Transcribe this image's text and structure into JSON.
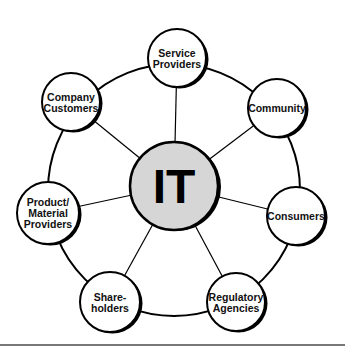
{
  "diagram": {
    "type": "hub-and-spoke",
    "center": {
      "label": "IT",
      "x": 174,
      "y": 186,
      "r": 44,
      "fill": "#d6d6d6"
    },
    "ring": {
      "cx": 174,
      "cy": 190,
      "r": 126
    },
    "nodes": [
      {
        "id": "service-providers",
        "lines": [
          "Service",
          "Providers"
        ],
        "x": 177,
        "y": 58,
        "r": 29
      },
      {
        "id": "community",
        "lines": [
          "Community"
        ],
        "x": 277,
        "y": 108,
        "r": 29
      },
      {
        "id": "consumers",
        "lines": [
          "Consumers"
        ],
        "x": 296,
        "y": 216,
        "r": 29
      },
      {
        "id": "regulatory-agencies",
        "lines": [
          "Regulatory",
          "Agencies"
        ],
        "x": 236,
        "y": 302,
        "r": 29
      },
      {
        "id": "shareholders",
        "lines": [
          "Share-",
          "holders"
        ],
        "x": 110,
        "y": 302,
        "r": 30
      },
      {
        "id": "product-material-providers",
        "lines": [
          "Product/",
          "Material",
          "Providers"
        ],
        "x": 48,
        "y": 213,
        "r": 31
      },
      {
        "id": "company-customers",
        "lines": [
          "Company",
          "Customers"
        ],
        "x": 71,
        "y": 102,
        "r": 29
      }
    ],
    "colors": {
      "stroke": "#000000",
      "node_fill": "#ffffff",
      "center_fill": "#d6d6d6",
      "divider": "#777777"
    }
  }
}
